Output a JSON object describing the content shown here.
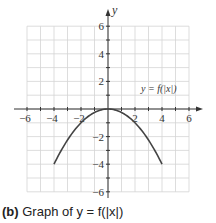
{
  "chart_data": {
    "type": "line",
    "title": "",
    "caption_prefix": "(b)",
    "caption_text": "Graph of y = f(|x|)",
    "xlabel": "",
    "ylabel": "y",
    "xlim": [
      -6.5,
      6.5
    ],
    "ylim": [
      -7,
      7
    ],
    "grid": true,
    "x_ticks": [
      -6,
      -4,
      -2,
      2,
      4,
      6
    ],
    "y_ticks": [
      6,
      4,
      2,
      -2,
      -4,
      -6
    ],
    "annotation": "y = f(|x|)",
    "series": [
      {
        "name": "y = f(|x|)",
        "x": [
          -4,
          -3,
          -2,
          -1,
          0,
          1,
          2,
          3,
          4
        ],
        "y": [
          -4,
          -2.25,
          -1,
          -0.25,
          0,
          -0.25,
          -1,
          -2.25,
          -4
        ]
      }
    ]
  }
}
